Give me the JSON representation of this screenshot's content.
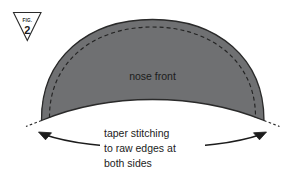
{
  "figure": {
    "badge": {
      "word": "FIG.",
      "number": "2",
      "shape": "inverted-triangle"
    },
    "piece": {
      "label": "nose front",
      "fill_color": "#6f7072",
      "outline_color": "#2a2a2a",
      "stitch_line_color": "#232323",
      "stitch_style": "dashed"
    },
    "caption": {
      "line1": "taper stitching",
      "line2": "to raw edges at",
      "line3": "both sides"
    },
    "annotation": {
      "arrow_style": "double-headed",
      "arrow_color": "#1c1c1c",
      "left_arrow_icon": "arrow-left-icon",
      "right_arrow_icon": "arrow-right-icon"
    },
    "background_color": "#ffffff"
  }
}
